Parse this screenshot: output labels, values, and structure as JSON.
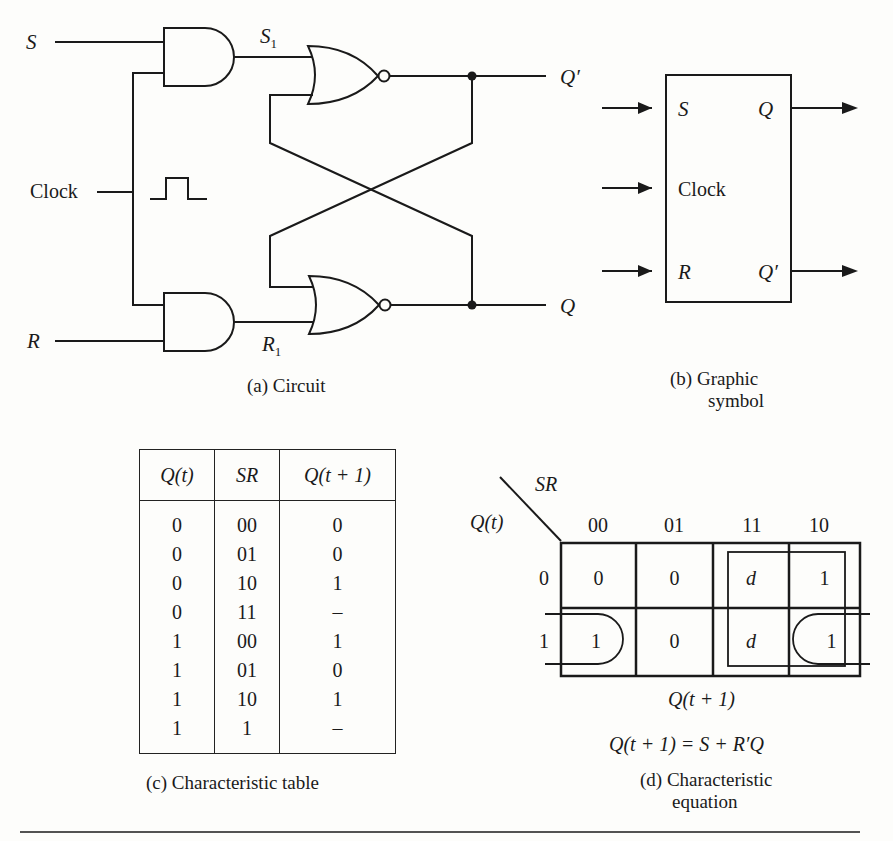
{
  "circuit": {
    "inputs": {
      "s": "S",
      "clock": "Clock",
      "r": "R"
    },
    "internal": {
      "s1_main": "S",
      "s1_sub": "1",
      "r1_main": "R",
      "r1_sub": "1"
    },
    "outputs": {
      "q_prime": "Q′",
      "q": "Q"
    },
    "caption": "(a)  Circuit"
  },
  "symbol": {
    "pins": {
      "s": "S",
      "clock": "Clock",
      "r": "R",
      "q": "Q",
      "q_prime": "Q′"
    },
    "caption_line1": "(b)  Graphic",
    "caption_line2": "symbol"
  },
  "table": {
    "headers": [
      "Q(t)",
      "SR",
      "Q(t  +  1)"
    ],
    "rows": [
      [
        "0",
        "00",
        "0"
      ],
      [
        "0",
        "01",
        "0"
      ],
      [
        "0",
        "10",
        "1"
      ],
      [
        "0",
        "11",
        "–"
      ],
      [
        "1",
        "00",
        "1"
      ],
      [
        "1",
        "01",
        "0"
      ],
      [
        "1",
        "10",
        "1"
      ],
      [
        "1",
        "1",
        "–"
      ]
    ],
    "caption": "(c)  Characteristic table"
  },
  "kmap": {
    "col_var": "SR",
    "row_var": "Q(t)",
    "col_labels": [
      "00",
      "01",
      "11",
      "10"
    ],
    "row_labels": [
      "0",
      "1"
    ],
    "cells": [
      [
        "0",
        "0",
        "d",
        "1"
      ],
      [
        "1",
        "0",
        "d",
        "1"
      ]
    ],
    "map_label": "Q(t  +  1)",
    "equation": "Q(t  +  1)  =  S  +  R′Q",
    "caption_line1": "(d)  Characteristic",
    "caption_line2": "equation"
  }
}
